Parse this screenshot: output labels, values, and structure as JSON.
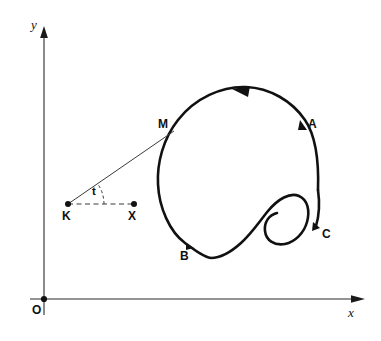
{
  "figure": {
    "type": "parametric-curve-diagram",
    "background_color": "#ffffff",
    "curve_color": "#111111",
    "axis_color": "#2b2b2b",
    "helper_color": "#3a3a3a",
    "width": 381,
    "height": 341
  },
  "axes": {
    "x_label": "x",
    "y_label": "y",
    "origin_label": "O",
    "origin": {
      "x": 44,
      "y": 299
    },
    "x_axis_end": {
      "x": 363,
      "y": 299
    },
    "y_axis_end": {
      "x": 44,
      "y": 28
    }
  },
  "points": [
    {
      "id": "O",
      "label": "O",
      "x": 44,
      "y": 299,
      "marker": "dot",
      "role": "origin"
    },
    {
      "id": "K",
      "label": "K",
      "x": 68,
      "y": 204,
      "marker": "dot",
      "role": "pole"
    },
    {
      "id": "X",
      "label": "X",
      "x": 134,
      "y": 204,
      "marker": "dot",
      "role": "reference-direction"
    },
    {
      "id": "M",
      "label": "M",
      "x": 172,
      "y": 133,
      "marker": "none",
      "role": "curve-point"
    },
    {
      "id": "A",
      "label": "A",
      "x": 303,
      "y": 127,
      "marker": "arrowhead",
      "role": "curve-point"
    },
    {
      "id": "B",
      "label": "B",
      "x": 190,
      "y": 247,
      "marker": "arrowhead",
      "role": "curve-point"
    },
    {
      "id": "C",
      "label": "C",
      "x": 317,
      "y": 228,
      "marker": "arrowhead",
      "role": "curve-point"
    }
  ],
  "angle": {
    "label": "t",
    "vertex": "K",
    "from_ray": "K-X",
    "to_ray": "K-M",
    "label_x": 94,
    "label_y": 191
  },
  "segments": [
    {
      "id": "radius",
      "from": "K",
      "to": "M",
      "style": "solid"
    },
    {
      "id": "reference",
      "from": "K",
      "to": "X",
      "style": "dashed"
    }
  ],
  "direction_arrows": [
    {
      "id": "top-arrow",
      "x": 243,
      "y": 93,
      "orientation": "leftward",
      "meaning": "counterclockwise-traversal"
    }
  ],
  "curve": {
    "closed": false,
    "description": "closed-ish loop with inner hook/spiral on the lower right",
    "start_point": "A-side top",
    "end_point": "C"
  }
}
